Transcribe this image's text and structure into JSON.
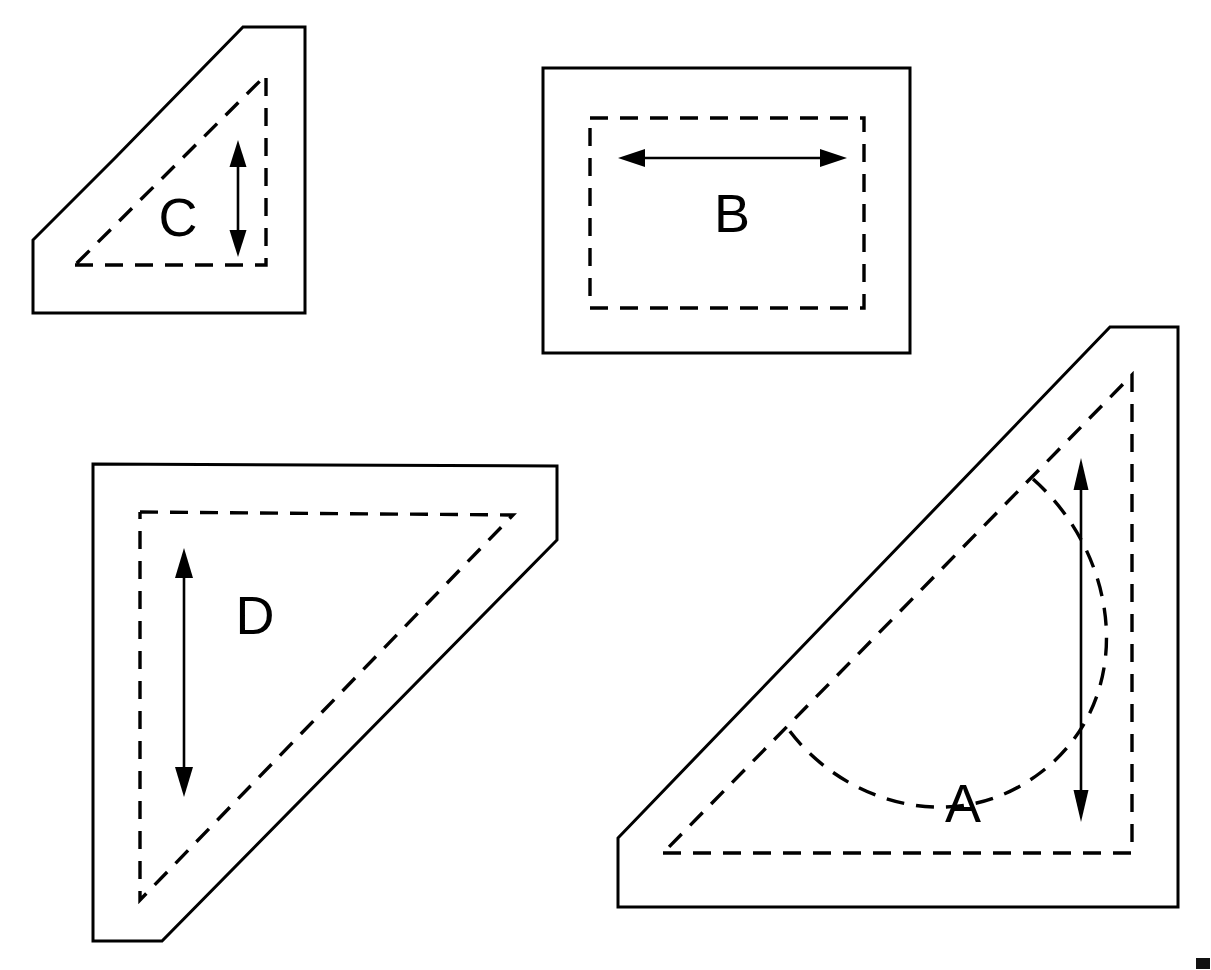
{
  "figure": {
    "title": "Four labeled solid shapes with hidden-line detail and dimension arrows",
    "background_color": "#ffffff",
    "line_color": "#000000",
    "canvas": {
      "width": 1211,
      "height": 970
    },
    "label_font_size": 54,
    "stroke_widths": {
      "outline": 3,
      "hidden": 3.4,
      "dimension": 2.6
    },
    "dash_pattern": "18 12"
  },
  "shapes": [
    {
      "id": "shape-c",
      "label": "C",
      "label_x": 178,
      "label_y": 222,
      "description": "right-triangular block, beveled upper-left, vertical dimension arrow",
      "outline_points": "33,240 115,158 243,27 305,27 305,313 33,313",
      "hidden_path": "M 75,265 L 266,265 L 266,75 L 75,265",
      "arrow": {
        "orientation": "vertical",
        "x1": 238,
        "y1": 142,
        "x2": 238,
        "y2": 255,
        "head_length": 26,
        "head_width": 17
      }
    },
    {
      "id": "shape-b",
      "label": "B",
      "label_x": 732,
      "label_y": 218,
      "description": "rectangular block with hidden inner rectangle and horizontal dimension arrow",
      "outline_points": "543,68 910,68 910,353 543,353",
      "hidden_path": "M 590,118 L 864,118 L 864,308 L 590,308 Z",
      "arrow": {
        "orientation": "horizontal",
        "x1": 620,
        "y1": 158,
        "x2": 845,
        "y2": 158,
        "head_length": 26,
        "head_width": 17
      }
    },
    {
      "id": "shape-d",
      "label": "D",
      "label_x": 255,
      "label_y": 620,
      "description": "right-triangular block, beveled lower-left and right, vertical dimension arrow",
      "outline_points": "93,464 557,466 557,540 162,941 93,941",
      "hidden_path": "M 140,512 L 513,515 L 140,900 L 140,512",
      "arrow": {
        "orientation": "vertical",
        "x1": 184,
        "y1": 550,
        "x2": 184,
        "y2": 795,
        "head_length": 30,
        "head_width": 18
      }
    },
    {
      "id": "shape-a",
      "label": "A",
      "label_x": 963,
      "label_y": 808,
      "description": "large right-triangular block with beveled upper-left, hidden semicircular pocket and vertical dimension arrow",
      "outline_points": "618,838 1110,327 1178,327 1178,907 618,907",
      "hidden_path": "M 663,853 L 1132,853 L 1132,375 L 663,853",
      "arc_path": "M 1033,479 C 1122,558 1137,700 1040,773 C 952,840 838,800 786,726",
      "arrow": {
        "orientation": "vertical",
        "x1": 1081,
        "y1": 460,
        "x2": 1081,
        "y2": 820,
        "head_length": 30,
        "head_width": 15
      }
    }
  ],
  "corner_mark": {
    "present": true,
    "x": 1196,
    "y": 958,
    "width": 14,
    "height": 11
  }
}
